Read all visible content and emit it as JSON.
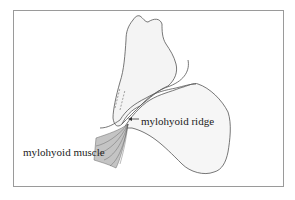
{
  "figure": {
    "labels": {
      "ridge": "mylohyoid ridge",
      "muscle": "mylohyoid muscle"
    },
    "caption": "Fig. 3.3 ... (caption text cut off at bottom edge)"
  },
  "colors": {
    "line": "#555555",
    "frame": "#9a9a9a",
    "fill": "#f3f3f3",
    "muscle": "#b9b9b9"
  }
}
